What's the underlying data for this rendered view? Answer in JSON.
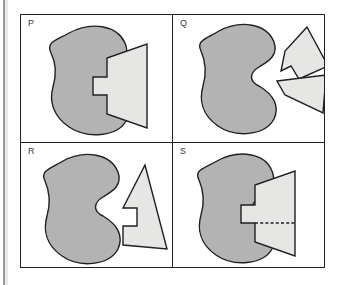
{
  "figure": {
    "background_color": "#ffffff",
    "frame_color": "#231f20",
    "blob_fill": "#b3b3b3",
    "polygon_fill": "#e6e6e4",
    "panels": [
      {
        "id": "p",
        "label": "P",
        "description": "Gray blob with a light notched triangle overlapping its right side, fitted into the blob's concave notch.",
        "shapes": [
          {
            "name": "blob",
            "fill": "#b3b3b3",
            "path": "M 48 18 C 70 6, 96 10, 104 28 C 110 42, 100 50, 92 56 C 84 62, 84 70, 92 76 C 101 83, 112 92, 105 106 C 96 122, 66 124, 48 112 C 32 101, 28 86, 32 72 C 36 58, 34 46, 30 38 C 25 27, 34 26, 48 18 Z"
          },
          {
            "name": "notched-triangle",
            "fill": "#e6e6e4",
            "path": "M 126 29 L 126 113 L 86 99 L 86 80 L 72 80 L 72 62 L 86 62 L 86 43 Z"
          }
        ]
      },
      {
        "id": "q",
        "label": "Q",
        "description": "Gray blob with a wavy concave bite on its right edge, plus two separate light polygons placed to the right.",
        "shapes": [
          {
            "name": "blob",
            "fill": "#b3b3b3",
            "path": "M 46 16 C 68 4, 94 9, 101 27 C 106 41, 94 47, 86 52 C 76 58, 76 66, 86 71 C 96 77, 108 88, 101 104 C 92 121, 62 123, 45 111 C 29 100, 26 85, 30 71 C 34 57, 32 45, 28 36 C 23 26, 32 24, 46 16 Z"
          },
          {
            "name": "arrow-polygon",
            "fill": "#e6e6e4",
            "path": "M 134 12 L 155 51 L 126 64 L 118 51 L 108 56 L 112 36 Z"
          },
          {
            "name": "trapezoid-polygon",
            "fill": "#e6e6e4",
            "path": "M 104 66 L 153 60 L 150 98 L 112 80 Z"
          }
        ]
      },
      {
        "id": "r",
        "label": "R",
        "description": "Gray blob with a wavy concave bite, and one light notched triangle standing separately to its right.",
        "shapes": [
          {
            "name": "blob",
            "fill": "#b3b3b3",
            "path": "M 42 18 C 64 6, 90 11, 97 29 C 102 43, 90 49, 82 54 C 72 60, 72 68, 82 73 C 92 79, 104 90, 97 106 C 88 123, 58 125, 41 113 C 25 102, 22 87, 26 73 C 30 59, 28 47, 24 38 C 19 28, 28 26, 42 18 Z"
          },
          {
            "name": "notched-triangle",
            "fill": "#e6e6e4",
            "path": "M 124 22 L 146 106 L 102 102 L 102 83 L 116 83 L 116 65 L 102 65 Z"
          }
        ]
      },
      {
        "id": "s",
        "label": "S",
        "description": "Gray blob with a light notched triangle overlapping its right side, and a horizontal dashed cut line across the lower part of the triangle.",
        "shapes": [
          {
            "name": "blob",
            "fill": "#b3b3b3",
            "path": "M 44 18 C 66 6, 92 10, 99 28 C 105 42, 94 49, 86 55 C 77 61, 77 69, 86 75 C 95 82, 106 92, 99 106 C 90 122, 60 124, 43 112 C 27 101, 24 86, 28 72 C 32 58, 30 46, 26 37 C 21 27, 30 26, 44 18 Z"
          },
          {
            "name": "notched-triangle",
            "fill": "#e6e6e4",
            "path": "M 122 28 L 122 113 L 82 99 L 82 80 L 68 80 L 68 62 L 82 62 L 82 42 Z"
          },
          {
            "name": "dashed-cut-line",
            "stroke": "#231f20",
            "path": "M 82 80 L 122 80"
          }
        ]
      }
    ]
  }
}
